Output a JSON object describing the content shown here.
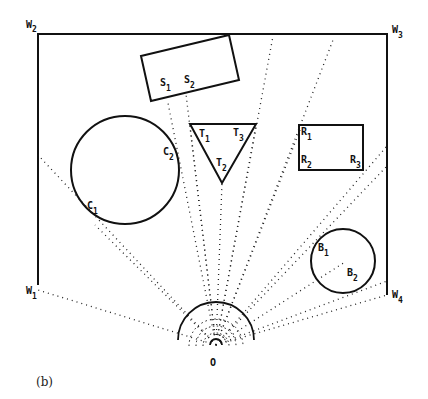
{
  "figure": {
    "caption": "(b)",
    "origin_label": "O",
    "walls": [
      {
        "id": "W1",
        "letter": "W",
        "sub": "1"
      },
      {
        "id": "W2",
        "letter": "W",
        "sub": "2"
      },
      {
        "id": "W3",
        "letter": "W",
        "sub": "3"
      },
      {
        "id": "W4",
        "letter": "W",
        "sub": "4"
      }
    ],
    "obstacles": {
      "S": {
        "shape": "rotated-rectangle",
        "points": [
          {
            "letter": "S",
            "sub": "1"
          },
          {
            "letter": "S",
            "sub": "2"
          }
        ]
      },
      "T": {
        "shape": "triangle",
        "points": [
          {
            "letter": "T",
            "sub": "1"
          },
          {
            "letter": "T",
            "sub": "2"
          },
          {
            "letter": "T",
            "sub": "3"
          }
        ]
      },
      "R": {
        "shape": "rectangle",
        "points": [
          {
            "letter": "R",
            "sub": "1"
          },
          {
            "letter": "R",
            "sub": "2"
          },
          {
            "letter": "R",
            "sub": "3"
          }
        ]
      },
      "C": {
        "shape": "circle",
        "points": [
          {
            "letter": "C",
            "sub": "1"
          },
          {
            "letter": "C",
            "sub": "2"
          }
        ]
      },
      "B": {
        "shape": "circle",
        "points": [
          {
            "letter": "B",
            "sub": "1"
          },
          {
            "letter": "B",
            "sub": "2"
          }
        ]
      }
    },
    "colors": {
      "line": "#111111",
      "background": "#ffffff"
    }
  }
}
